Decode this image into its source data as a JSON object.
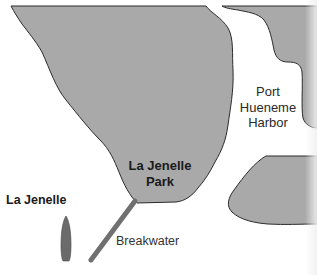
{
  "map": {
    "labels": {
      "harbor": [
        "Port",
        "Hueneme",
        "Harbor"
      ],
      "park": [
        "La Jenelle",
        "Park"
      ],
      "ship": "La Jenelle",
      "breakwater": "Breakwater"
    },
    "colors": {
      "land": "#a9a9a9",
      "land_outline": "#2b2b2b",
      "water": "#ffffff",
      "breakwater": "#707070",
      "ship": "#6b6b6b"
    }
  }
}
